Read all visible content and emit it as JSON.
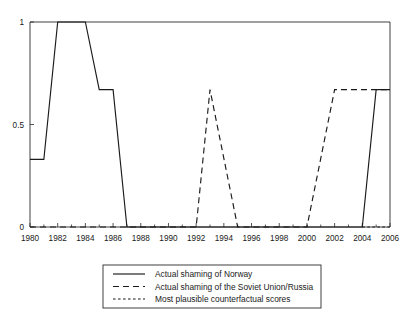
{
  "chart_data": {
    "type": "line",
    "title": "",
    "subtitle": "",
    "xlabel": "",
    "ylabel": "",
    "xlim": [
      1980,
      2006
    ],
    "ylim": [
      0,
      1
    ],
    "grid": false,
    "legend_position": "bottom-center",
    "x_ticks": [
      1980,
      1982,
      1984,
      1986,
      1988,
      1990,
      1992,
      1994,
      1996,
      1998,
      2000,
      2002,
      2004,
      2006
    ],
    "x_tick_labels": [
      "1980",
      "1982",
      "1984",
      "1986",
      "1988",
      "1990",
      "1992",
      "1994",
      "1996",
      "1998",
      "2000",
      "2002",
      "2004",
      "2006"
    ],
    "x_minor_ticks": [
      1981,
      1983,
      1985,
      1987,
      1989,
      1991,
      1993,
      1995,
      1997,
      1999,
      2001,
      2003,
      2005
    ],
    "y_ticks": [
      0,
      0.5,
      1
    ],
    "y_tick_labels": [
      "0",
      "0.5",
      "1"
    ],
    "series": [
      {
        "name": "Actual shaming of Norway",
        "style": "solid",
        "color": "#1a1a1a",
        "x": [
          1980,
          1981,
          1982,
          1984,
          1985,
          1986,
          1987,
          2004,
          2005,
          2006
        ],
        "values": [
          0.33,
          0.33,
          1.0,
          1.0,
          0.67,
          0.67,
          0.0,
          0.0,
          0.67,
          0.67
        ]
      },
      {
        "name": "Actual shaming of the Soviet Union/Russia",
        "style": "dashed",
        "color": "#1a1a1a",
        "x": [
          1980,
          1992,
          1993,
          1995,
          2000,
          2002,
          2006
        ],
        "values": [
          0.0,
          0.0,
          0.67,
          0.0,
          0.0,
          0.67,
          0.67
        ]
      },
      {
        "name": "Most plausible counterfactual scores",
        "style": "dotted",
        "color": "#1a1a1a",
        "x": [
          2004,
          2006
        ],
        "values": [
          0.0,
          0.0
        ]
      }
    ]
  },
  "legend": {
    "items": [
      {
        "label": "Actual shaming of Norway",
        "style": "solid"
      },
      {
        "label": "Actual shaming of the Soviet Union/Russia",
        "style": "dashed"
      },
      {
        "label": "Most plausible counterfactual scores",
        "style": "dotted"
      }
    ]
  },
  "axes": {
    "y_labels": [
      "1",
      "0.5",
      "0"
    ],
    "x_labels": [
      "1980",
      "1982",
      "1984",
      "1986",
      "1988",
      "1990",
      "1992",
      "1994",
      "1996",
      "1998",
      "2000",
      "2002",
      "2004",
      "2006"
    ]
  }
}
